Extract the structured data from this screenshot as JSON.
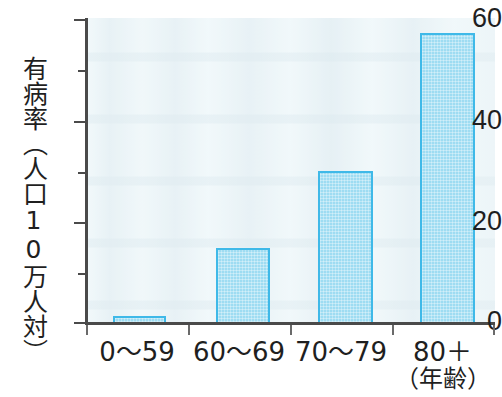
{
  "chart_data": {
    "type": "bar",
    "title": "",
    "subtitle": "",
    "xlabel": "（年齢）",
    "ylabel": "有病率（人口10万人対）",
    "categories": [
      "0〜59",
      "60〜69",
      "70〜79",
      "80＋"
    ],
    "values": [
      1.5,
      15,
      30,
      57
    ],
    "ylim": [
      0,
      60
    ],
    "y_major_ticks": [
      0,
      20,
      40,
      60
    ],
    "y_minor_ticks": [
      10,
      30,
      50
    ],
    "y_tick_labels": [
      "0",
      "20",
      "40",
      "60"
    ],
    "grid": false,
    "legend": null,
    "legend_position": "none",
    "series": [
      {
        "name": "有病率",
        "values": [
          1.5,
          15,
          30,
          57
        ]
      }
    ],
    "colors": {
      "bar_fill": "#9edcf2",
      "bar_border": "#3fb9e8",
      "axis": "#4a4a4a",
      "plot_background": "#f3fafc",
      "text": "#1f1f1f"
    }
  },
  "axes": {
    "y_title": "有病率（人口10万人対）",
    "y_labels": [
      {
        "text": "60",
        "value": 60
      },
      {
        "text": "40",
        "value": 40
      },
      {
        "text": "20",
        "value": 20
      },
      {
        "text": "0",
        "value": 0
      }
    ],
    "x_labels": [
      {
        "main": "0〜59",
        "sub": ""
      },
      {
        "main": "60〜69",
        "sub": ""
      },
      {
        "main": "70〜79",
        "sub": ""
      },
      {
        "main": "80＋",
        "sub": "（年齢）"
      }
    ]
  }
}
